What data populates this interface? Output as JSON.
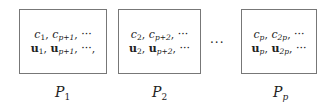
{
  "diagram": {
    "partitions": [
      {
        "label": "P",
        "label_sub": "1",
        "line1": "c_1, c_{p+1}, ···",
        "line2": "u_1, u_{p+1}, ···,",
        "c_subs": [
          "1",
          "p+1"
        ],
        "u_subs": [
          "1",
          "p+1"
        ],
        "trail1": ", ···",
        "trail2": ", ···,"
      },
      {
        "label": "P",
        "label_sub": "2",
        "line1": "c_2, c_{p+2}, ···",
        "line2": "u_2, u_{p+2}, ···",
        "c_subs": [
          "2",
          "p+2"
        ],
        "u_subs": [
          "2",
          "p+2"
        ],
        "trail1": ", ···",
        "trail2": ", ···"
      },
      {
        "label": "P",
        "label_sub": "p",
        "line1": "c_p, c_{2p}, ···",
        "line2": "u_p, u_{2p}, ···",
        "c_subs": [
          "p",
          "2p"
        ],
        "u_subs": [
          "p",
          "2p"
        ],
        "trail1": ", ···",
        "trail2": ", ···"
      }
    ],
    "ellipsis": "···",
    "c_symbol": "c",
    "u_symbol": "u",
    "comma": ", "
  }
}
